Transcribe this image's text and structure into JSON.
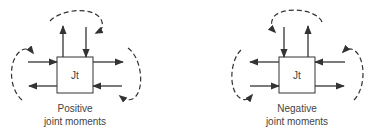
{
  "diagrams": [
    {
      "id": "positive",
      "joint_label": "Jt",
      "caption_line1": "Positive",
      "caption_line2": "joint moments"
    },
    {
      "id": "negative",
      "joint_label": "Jt",
      "caption_line1": "Negative",
      "caption_line2": "joint moments"
    }
  ]
}
